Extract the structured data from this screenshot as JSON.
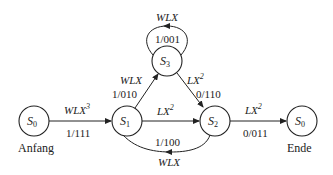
{
  "diagram": {
    "type": "state-machine",
    "states": [
      {
        "id": "s0_start",
        "name": "S",
        "sub": "0",
        "caption": "Anfang"
      },
      {
        "id": "s1",
        "name": "S",
        "sub": "1"
      },
      {
        "id": "s2",
        "name": "S",
        "sub": "2"
      },
      {
        "id": "s3",
        "name": "S",
        "sub": "3"
      },
      {
        "id": "s0_end",
        "name": "S",
        "sub": "0",
        "caption": "Ende"
      }
    ],
    "transitions": [
      {
        "from": "s0_start",
        "to": "s1",
        "input": "WLX",
        "input_sup": "3",
        "output": "1/111"
      },
      {
        "from": "s1",
        "to": "s3",
        "input": "WLX",
        "input_sup": "",
        "output": "1/010"
      },
      {
        "from": "s3",
        "to": "s3",
        "input": "WLX",
        "input_sup": "",
        "output": "1/001"
      },
      {
        "from": "s3",
        "to": "s2",
        "input": "LX",
        "input_sup": "2",
        "output": "0/110"
      },
      {
        "from": "s1",
        "to": "s2",
        "input": "LX",
        "input_sup": "2",
        "output": ""
      },
      {
        "from": "s2",
        "to": "s1",
        "input": "WLX",
        "input_sup": "",
        "output": "1/100"
      },
      {
        "from": "s2",
        "to": "s0_end",
        "input": "LX",
        "input_sup": "2",
        "output": "0/011"
      }
    ]
  }
}
